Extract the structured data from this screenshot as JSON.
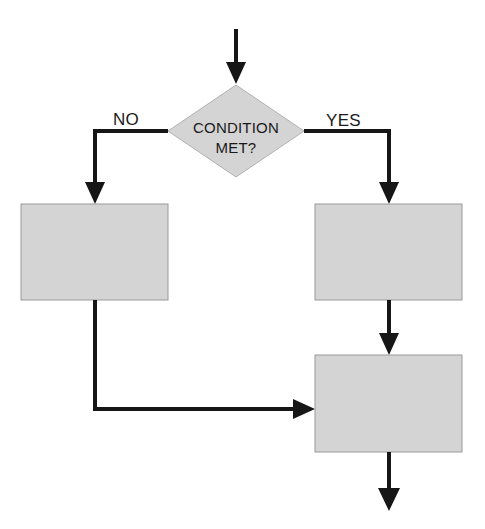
{
  "diagram": {
    "type": "flowchart",
    "canvas": {
      "width": 485,
      "height": 529,
      "background": "#ffffff"
    },
    "palette": {
      "node_fill": "#d4d4d4",
      "node_stroke": "#9a9a9a",
      "connector": "#161616",
      "text": "#1a1a1a"
    },
    "decision": {
      "shape": "diamond",
      "line1": "CONDITION",
      "line2": "MET?",
      "center_x": 236,
      "center_y": 131,
      "half_width": 68,
      "half_height": 46
    },
    "branch_labels": {
      "no": "NO",
      "yes": "YES"
    },
    "process_nodes": [
      {
        "id": "no-branch-process",
        "x": 21,
        "y": 204,
        "width": 147,
        "height": 96,
        "label": ""
      },
      {
        "id": "yes-branch-process",
        "x": 315,
        "y": 204,
        "width": 147,
        "height": 96,
        "label": ""
      },
      {
        "id": "merge-process",
        "x": 315,
        "y": 355,
        "width": 147,
        "height": 97,
        "label": ""
      }
    ],
    "connectors": [
      {
        "id": "entry-arrow",
        "from": "start",
        "to": "decision",
        "orientation": "vertical-down"
      },
      {
        "id": "no-branch-arrow",
        "from": "decision",
        "to": "no-branch-process",
        "orientation": "left-then-down",
        "label": "NO"
      },
      {
        "id": "yes-branch-arrow",
        "from": "decision",
        "to": "yes-branch-process",
        "orientation": "right-then-down",
        "label": "YES"
      },
      {
        "id": "yes-to-merge-arrow",
        "from": "yes-branch-process",
        "to": "merge-process",
        "orientation": "vertical-down"
      },
      {
        "id": "no-to-merge-arrow",
        "from": "no-branch-process",
        "to": "merge-process",
        "orientation": "down-then-right"
      },
      {
        "id": "exit-arrow",
        "from": "merge-process",
        "to": "end",
        "orientation": "vertical-down"
      }
    ]
  }
}
